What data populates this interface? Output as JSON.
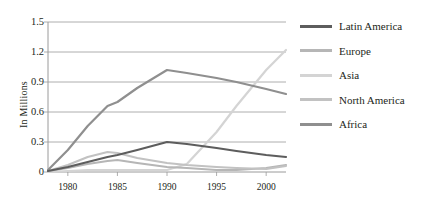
{
  "chart_data": {
    "type": "line",
    "title": "",
    "xlabel": "",
    "ylabel": "In Millions",
    "xlim": [
      1978,
      2002
    ],
    "ylim": [
      0,
      1.5
    ],
    "grid": true,
    "legend_position": "right",
    "xticks": [
      1980,
      1985,
      1990,
      1995,
      2000
    ],
    "xtick_labels": [
      "1980",
      "1985",
      "1990",
      "1995",
      "2000"
    ],
    "yticks": [
      0,
      0.3,
      0.6,
      0.9,
      1.2,
      1.5
    ],
    "ytick_labels": [
      "0",
      "0.3",
      "0.6",
      "0.9",
      "1.2",
      "1.5"
    ],
    "x": [
      1978,
      1980,
      1982,
      1984,
      1985,
      1987,
      1990,
      1992,
      1995,
      1997,
      2000,
      2002
    ],
    "series": [
      {
        "name": "Latin America",
        "color": "#5d5d5d",
        "values": [
          0.01,
          0.05,
          0.1,
          0.15,
          0.17,
          0.22,
          0.3,
          0.28,
          0.24,
          0.21,
          0.17,
          0.15
        ]
      },
      {
        "name": "Europe",
        "color": "#b6b6b6",
        "values": [
          0.01,
          0.04,
          0.08,
          0.11,
          0.12,
          0.09,
          0.05,
          0.04,
          0.02,
          0.02,
          0.04,
          0.07
        ]
      },
      {
        "name": "Asia",
        "color": "#d4d4d4",
        "values": [
          0.0,
          0.01,
          0.02,
          0.02,
          0.02,
          0.02,
          0.02,
          0.08,
          0.4,
          0.66,
          1.02,
          1.22
        ]
      },
      {
        "name": "North America",
        "color": "#c2c2c2",
        "values": [
          0.01,
          0.07,
          0.15,
          0.2,
          0.19,
          0.14,
          0.09,
          0.07,
          0.05,
          0.04,
          0.03,
          0.06
        ]
      },
      {
        "name": "Africa",
        "color": "#8f8f8f",
        "values": [
          0.02,
          0.22,
          0.46,
          0.66,
          0.7,
          0.84,
          1.02,
          0.99,
          0.94,
          0.9,
          0.83,
          0.78
        ]
      }
    ]
  },
  "legend": {
    "items": [
      {
        "label": "Latin America",
        "color": "#5d5d5d"
      },
      {
        "label": "Europe",
        "color": "#b6b6b6"
      },
      {
        "label": "Asia",
        "color": "#d4d4d4"
      },
      {
        "label": "North America",
        "color": "#c2c2c2"
      },
      {
        "label": "Africa",
        "color": "#8f8f8f"
      }
    ]
  },
  "axes": {
    "y_axis_title": "In Millions",
    "grid_color": "#9a9a9a",
    "axis_color": "#9a9a9a"
  }
}
